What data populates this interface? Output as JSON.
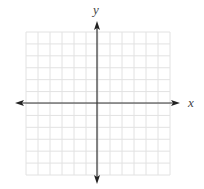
{
  "figure": {
    "type": "coordinate-plane",
    "x_axis_label": "x",
    "y_axis_label": "y",
    "grid": {
      "columns": 12,
      "rows": 12,
      "x_range": [
        -6,
        6
      ],
      "y_range": [
        -6,
        6
      ],
      "visible": true
    },
    "colors": {
      "grid_line": "#e2e2e2",
      "axis_line": "#333333",
      "label": "#444444",
      "background": "#ffffff"
    },
    "arrows": [
      "left",
      "right",
      "up",
      "down"
    ],
    "tick_labels": []
  }
}
